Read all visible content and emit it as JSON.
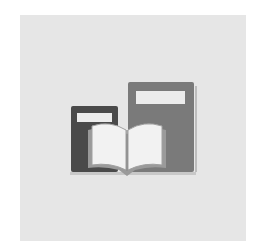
{
  "icon": {
    "name": "books-icon",
    "description": "Two closed books with an open book in front",
    "colors": {
      "page_background": "#ffffff",
      "tile_background": "#e6e6e6",
      "dark_book": "#4a4a4a",
      "medium_book": "#7a7a7a",
      "label": "#ececec",
      "open_book_pages": "#f2f2f2"
    }
  }
}
